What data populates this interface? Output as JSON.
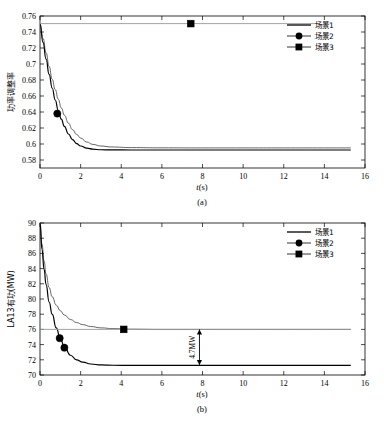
{
  "figure": {
    "background": "#ffffff",
    "axis_color": "#000000",
    "series_colors": {
      "scenario1": "#555555",
      "scenario2": "#000000",
      "scenario3": "#999999"
    }
  },
  "legend": {
    "items": [
      {
        "label": "场景1",
        "marker": "line"
      },
      {
        "label": "场景2",
        "marker": "circle"
      },
      {
        "label": "场景3",
        "marker": "square"
      }
    ]
  },
  "chart_data": [
    {
      "type": "line",
      "panel": "a",
      "caption": "(a)",
      "title": "",
      "xlabel": "t(s)",
      "ylabel": "功率调整率",
      "xlim": [
        0,
        16
      ],
      "ylim": [
        0.57,
        0.76
      ],
      "xticks": [
        0,
        2,
        4,
        6,
        8,
        10,
        12,
        14,
        16
      ],
      "yticks": [
        0.58,
        0.6,
        0.62,
        0.64,
        0.66,
        0.68,
        0.7,
        0.72,
        0.74,
        0.76
      ],
      "ytick_labels": [
        "0.58",
        "0.6",
        "0.62",
        "0.64",
        "0.66",
        "0.68",
        "0.7",
        "0.72",
        "0.74",
        "0.76"
      ],
      "grid": false,
      "legend_position": "top-right",
      "series": [
        {
          "name": "场景1",
          "style": "solid-gray",
          "x": [
            0,
            0.15,
            0.3,
            0.45,
            0.6,
            0.75,
            0.9,
            1.05,
            1.2,
            1.4,
            1.6,
            1.8,
            2.0,
            2.3,
            2.6,
            3.0,
            3.5,
            4.5,
            6,
            8,
            10,
            12,
            14,
            15.3
          ],
          "y": [
            0.75,
            0.732,
            0.714,
            0.697,
            0.681,
            0.668,
            0.656,
            0.645,
            0.636,
            0.626,
            0.618,
            0.612,
            0.6075,
            0.6025,
            0.5995,
            0.5975,
            0.5963,
            0.5955,
            0.5952,
            0.5951,
            0.5951,
            0.5951,
            0.5951,
            0.5951
          ]
        },
        {
          "name": "场景2",
          "style": "solid-black",
          "x": [
            0,
            0.15,
            0.3,
            0.45,
            0.6,
            0.75,
            0.9,
            1.05,
            1.2,
            1.4,
            1.6,
            1.8,
            2.0,
            2.3,
            2.6,
            3.0,
            3.5,
            4.5,
            6,
            8,
            10,
            12,
            14,
            15.3
          ],
          "y": [
            0.75,
            0.727,
            0.706,
            0.687,
            0.67,
            0.655,
            0.642,
            0.631,
            0.622,
            0.6125,
            0.6055,
            0.6005,
            0.5975,
            0.5948,
            0.5935,
            0.5928,
            0.5926,
            0.5925,
            0.5925,
            0.5925,
            0.5925,
            0.5925,
            0.5925,
            0.5925
          ]
        },
        {
          "name": "场景3",
          "style": "flat-gray",
          "x": [
            0,
            13.7
          ],
          "y": [
            0.7505,
            0.7505
          ]
        }
      ],
      "markers": [
        {
          "series": "场景2",
          "shape": "circle",
          "x": 0.85,
          "y": 0.638
        },
        {
          "series": "场景3",
          "shape": "square",
          "x": 7.42,
          "y": 0.7505
        }
      ]
    },
    {
      "type": "line",
      "panel": "b",
      "caption": "(b)",
      "title": "",
      "xlabel": "t(s)",
      "ylabel": "LA13有功(MW)",
      "xlim": [
        0,
        16
      ],
      "ylim": [
        70,
        90
      ],
      "xticks": [
        0,
        2,
        4,
        6,
        8,
        10,
        12,
        14,
        16
      ],
      "yticks": [
        70,
        72,
        74,
        76,
        78,
        80,
        82,
        84,
        86,
        88,
        90
      ],
      "ytick_labels": [
        "70",
        "72",
        "74",
        "76",
        "78",
        "80",
        "82",
        "84",
        "86",
        "88",
        "90"
      ],
      "grid": false,
      "legend_position": "top-right",
      "annotation": {
        "text": "4.7MW",
        "x": 7.85,
        "y_top": 76.0,
        "y_bottom": 71.3
      },
      "series": [
        {
          "name": "场景1",
          "style": "solid-gray",
          "x": [
            0,
            0.1,
            0.2,
            0.3,
            0.45,
            0.6,
            0.8,
            1.0,
            1.2,
            1.5,
            1.8,
            2.1,
            2.5,
            3.0,
            3.6,
            4.5,
            6,
            8,
            10,
            12,
            14,
            15.3
          ],
          "y": [
            90.0,
            87.2,
            85.0,
            83.3,
            81.5,
            80.3,
            79.2,
            78.45,
            77.9,
            77.3,
            76.9,
            76.63,
            76.38,
            76.2,
            76.1,
            76.03,
            76.0,
            76.0,
            76.0,
            76.0,
            76.0,
            76.0
          ]
        },
        {
          "name": "场景2",
          "style": "solid-black",
          "x": [
            0,
            0.1,
            0.2,
            0.3,
            0.45,
            0.6,
            0.8,
            1.0,
            1.2,
            1.5,
            1.8,
            2.1,
            2.5,
            3.0,
            3.6,
            4.5,
            6,
            8,
            10,
            12,
            14,
            15.3
          ],
          "y": [
            90.0,
            86.5,
            83.9,
            81.9,
            79.6,
            78.0,
            76.2,
            74.8,
            73.7,
            72.6,
            72.0,
            71.7,
            71.45,
            71.32,
            71.28,
            71.27,
            71.27,
            71.27,
            71.27,
            71.27,
            71.27,
            71.27
          ]
        },
        {
          "name": "场景3",
          "style": "flat-gray",
          "x": [
            0,
            15.3
          ],
          "y": [
            76.0,
            76.0
          ]
        }
      ],
      "markers": [
        {
          "series": "场景2",
          "shape": "circle",
          "x": 0.97,
          "y": 74.85
        },
        {
          "series": "场景2",
          "shape": "circle",
          "x": 1.2,
          "y": 73.6
        },
        {
          "series": "场景3",
          "shape": "square",
          "x": 4.12,
          "y": 76.0
        }
      ]
    }
  ]
}
